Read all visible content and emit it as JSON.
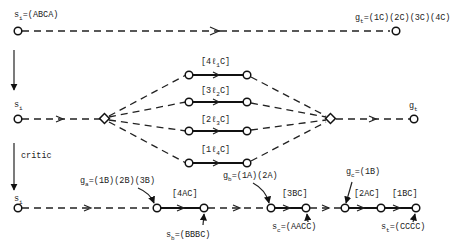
{
  "diagram": {
    "row1": {
      "start_label": "s",
      "start_sub": "i",
      "start_value": "=(ABCA)",
      "goal_label": "g",
      "goal_sub": "t",
      "goal_value": "=(1C)(2C)(3C)(4C)"
    },
    "row2": {
      "start_label": "s",
      "start_sub": "i",
      "goal_label": "g",
      "goal_sub": "t",
      "branches": [
        {
          "pre": "[4",
          "l": "ℓ",
          "sub": "1",
          "post": "C]"
        },
        {
          "pre": "[3",
          "l": "ℓ",
          "sub": "2",
          "post": "C]"
        },
        {
          "pre": "[2",
          "l": "ℓ",
          "sub": "3",
          "post": "C]"
        },
        {
          "pre": "[1",
          "l": "ℓ",
          "sub": "4",
          "post": "C]"
        }
      ]
    },
    "critic_label": "critic",
    "row3": {
      "start_label": "s",
      "start_sub": "i",
      "ga_label": "g",
      "ga_sub": "a",
      "ga_value": "=(1B)(2B)(3B)",
      "gb_label": "g",
      "gb_sub": "b",
      "gb_value": "=(1A)(2A)",
      "gc_label": "g",
      "gc_sub": "c",
      "gc_value": "=(1B)",
      "op1": "[4AC]",
      "op2": "[3BC]",
      "op3": "[2AC]",
      "op4": "[1BC]",
      "sb_label": "s",
      "sb_sub": "b",
      "sb_value": "=(BBBC)",
      "sc_label": "s",
      "sc_sub": "c",
      "sc_value": "=(AACC)",
      "st_label": "s",
      "st_sub": "t",
      "st_value": "=(CCCC)"
    }
  }
}
